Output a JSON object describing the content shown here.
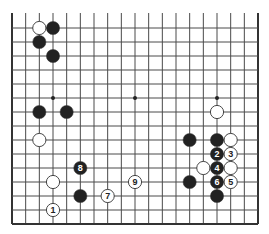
{
  "diagram": {
    "type": "go-board",
    "board_size": 19,
    "visible_rows": [
      4,
      18
    ],
    "visible_cols": [
      0,
      18
    ],
    "edges": {
      "left": true,
      "right": true,
      "bottom": true,
      "top": false
    },
    "star_points": [
      [
        3,
        9
      ],
      [
        9,
        9
      ],
      [
        15,
        9
      ],
      [
        3,
        15
      ],
      [
        9,
        15
      ],
      [
        15,
        15
      ]
    ],
    "colors": {
      "line": "#4a4a4a",
      "edge": "#333333",
      "black": "#222222",
      "white": "#ffffff",
      "stone_outline": "#333333"
    },
    "stones": [
      {
        "color": "white",
        "col": 2,
        "row": 4,
        "label": ""
      },
      {
        "color": "black",
        "col": 3,
        "row": 4,
        "label": ""
      },
      {
        "color": "black",
        "col": 2,
        "row": 5,
        "label": ""
      },
      {
        "color": "black",
        "col": 3,
        "row": 6,
        "label": ""
      },
      {
        "color": "black",
        "col": 2,
        "row": 10,
        "label": ""
      },
      {
        "color": "black",
        "col": 4,
        "row": 10,
        "label": ""
      },
      {
        "color": "white",
        "col": 2,
        "row": 12,
        "label": ""
      },
      {
        "color": "white",
        "col": 3,
        "row": 15,
        "label": ""
      },
      {
        "color": "white",
        "col": 3,
        "row": 17,
        "label": "1"
      },
      {
        "color": "black",
        "col": 5,
        "row": 14,
        "label": "8"
      },
      {
        "color": "black",
        "col": 5,
        "row": 16,
        "label": ""
      },
      {
        "color": "white",
        "col": 7,
        "row": 16,
        "label": "7"
      },
      {
        "color": "white",
        "col": 9,
        "row": 15,
        "label": "9"
      },
      {
        "color": "white",
        "col": 15,
        "row": 10,
        "label": ""
      },
      {
        "color": "black",
        "col": 13,
        "row": 12,
        "label": ""
      },
      {
        "color": "black",
        "col": 15,
        "row": 12,
        "label": ""
      },
      {
        "color": "white",
        "col": 16,
        "row": 12,
        "label": ""
      },
      {
        "color": "black",
        "col": 15,
        "row": 13,
        "label": "2"
      },
      {
        "color": "white",
        "col": 16,
        "row": 13,
        "label": "3"
      },
      {
        "color": "white",
        "col": 14,
        "row": 14,
        "label": ""
      },
      {
        "color": "black",
        "col": 15,
        "row": 14,
        "label": "4"
      },
      {
        "color": "white",
        "col": 16,
        "row": 14,
        "label": ""
      },
      {
        "color": "black",
        "col": 13,
        "row": 15,
        "label": ""
      },
      {
        "color": "black",
        "col": 15,
        "row": 15,
        "label": "6"
      },
      {
        "color": "white",
        "col": 16,
        "row": 15,
        "label": "5"
      },
      {
        "color": "black",
        "col": 15,
        "row": 16,
        "label": ""
      }
    ]
  }
}
